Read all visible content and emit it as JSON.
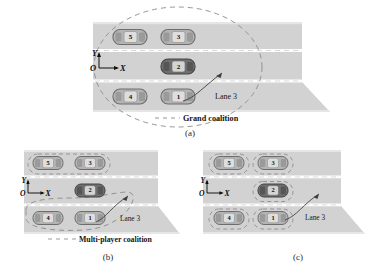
{
  "figure": {
    "panels": [
      {
        "id": "a",
        "caption": "(a)",
        "coalition_label": "Grand coalition",
        "lane_label": "Lane 3",
        "axes": {
          "x": "X",
          "y": "Y",
          "origin": "O"
        },
        "grouping": "grand",
        "vehicles": [
          {
            "id": "5",
            "lane": 1,
            "slot": 0,
            "shade": "light"
          },
          {
            "id": "3",
            "lane": 1,
            "slot": 1,
            "shade": "light"
          },
          {
            "id": "2",
            "lane": 2,
            "slot": 1,
            "shade": "dark"
          },
          {
            "id": "4",
            "lane": 3,
            "slot": 0,
            "shade": "light"
          },
          {
            "id": "1",
            "lane": 3,
            "slot": 1,
            "shade": "light"
          }
        ]
      },
      {
        "id": "b",
        "caption": "(b)",
        "coalition_label": "Multi-player coalition",
        "lane_label": "Lane 3",
        "axes": {
          "x": "X",
          "y": "Y",
          "origin": "O"
        },
        "grouping": "multi",
        "vehicles": [
          {
            "id": "5",
            "lane": 1,
            "slot": 0,
            "shade": "light"
          },
          {
            "id": "3",
            "lane": 1,
            "slot": 1,
            "shade": "light"
          },
          {
            "id": "2",
            "lane": 2,
            "slot": 1,
            "shade": "dark"
          },
          {
            "id": "4",
            "lane": 3,
            "slot": 0,
            "shade": "light"
          },
          {
            "id": "1",
            "lane": 3,
            "slot": 1,
            "shade": "light"
          }
        ]
      },
      {
        "id": "c",
        "caption": "(c)",
        "coalition_label": "",
        "lane_label": "Lane 3",
        "axes": {
          "x": "X",
          "y": "Y",
          "origin": "O"
        },
        "grouping": "individual",
        "vehicles": [
          {
            "id": "5",
            "lane": 1,
            "slot": 0,
            "shade": "light"
          },
          {
            "id": "3",
            "lane": 1,
            "slot": 1,
            "shade": "light"
          },
          {
            "id": "2",
            "lane": 2,
            "slot": 1,
            "shade": "dark"
          },
          {
            "id": "4",
            "lane": 3,
            "slot": 0,
            "shade": "light"
          },
          {
            "id": "1",
            "lane": 3,
            "slot": 1,
            "shade": "light"
          }
        ]
      }
    ],
    "colors": {
      "road": "#d2d2d2",
      "road_edge": "#bdbdbd",
      "lane_line": "#fdfdfd",
      "car_light": "#b4b4b4",
      "car_dark": "#6f6f6f",
      "car_outline": "#5f5f5f",
      "window": "#dedede",
      "dashed": "#8a8a8a",
      "arrow": "#3d3d3d",
      "text": "#141414",
      "background": "#ffffff"
    }
  }
}
